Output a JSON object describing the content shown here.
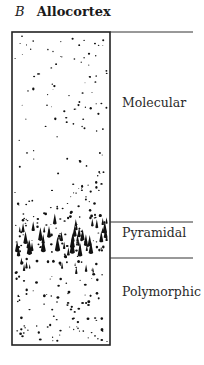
{
  "figure": {
    "panel_letter": "B",
    "title": "Allocortex"
  },
  "layers": [
    {
      "name": "Molecular",
      "label_y": 103
    },
    {
      "name": "Pyramidal",
      "label_y": 233
    },
    {
      "name": "Polymorphic",
      "label_y": 292
    }
  ],
  "colors": {
    "line": "#222222",
    "cells": "#111111"
  }
}
